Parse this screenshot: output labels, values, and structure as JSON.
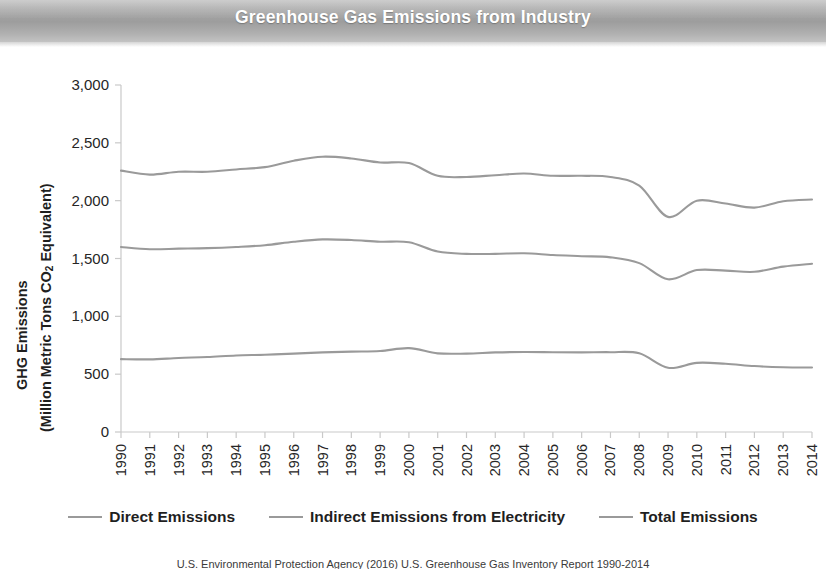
{
  "banner": {
    "title": "Greenhouse Gas Emissions from Industry",
    "background_color": "#a9a9a9",
    "text_color": "#ffffff"
  },
  "axis": {
    "y_title_line1": "GHG Emissions",
    "y_title_line2_pre": "(Million Metric Tons CO",
    "y_title_line2_sub": "2",
    "y_title_line2_post": " Equivalent)"
  },
  "legend": {
    "items": [
      {
        "label": "Direct Emissions",
        "color": "#9a9a9a"
      },
      {
        "label": "Indirect Emissions from Electricity",
        "color": "#9a9a9a"
      },
      {
        "label": "Total Emissions",
        "color": "#9a9a9a"
      }
    ]
  },
  "caption": {
    "text": "U.S. Environmental Protection Agency (2016) U.S. Greenhouse Gas Inventory Report 1990-2014"
  },
  "chart_data": {
    "type": "line",
    "title": "Greenhouse Gas Emissions from Industry",
    "xlabel": "",
    "ylabel": "GHG Emissions (Million Metric Tons CO2 Equivalent)",
    "ylim": [
      0,
      3000
    ],
    "yticks": [
      0,
      500,
      1000,
      1500,
      2000,
      2500,
      3000
    ],
    "ytick_labels": [
      "0",
      "500",
      "1,000",
      "1,500",
      "2,000",
      "2,500",
      "3,000"
    ],
    "grid": false,
    "legend_position": "bottom",
    "categories": [
      "1990",
      "1991",
      "1992",
      "1993",
      "1994",
      "1995",
      "1996",
      "1997",
      "1998",
      "1999",
      "2000",
      "2001",
      "2002",
      "2003",
      "2004",
      "2005",
      "2006",
      "2007",
      "2008",
      "2009",
      "2010",
      "2011",
      "2012",
      "2013",
      "2014"
    ],
    "series": [
      {
        "name": "Total Emissions",
        "color": "#9a9a9a",
        "values": [
          2260,
          2225,
          2250,
          2250,
          2270,
          2290,
          2345,
          2380,
          2365,
          2330,
          2325,
          2215,
          2205,
          2220,
          2235,
          2215,
          2215,
          2205,
          2130,
          1860,
          2000,
          1975,
          1940,
          1995,
          2010
        ]
      },
      {
        "name": "Indirect Emissions from Electricity",
        "color": "#9a9a9a",
        "values": [
          1600,
          1580,
          1585,
          1590,
          1600,
          1615,
          1645,
          1665,
          1660,
          1645,
          1640,
          1560,
          1540,
          1540,
          1545,
          1530,
          1520,
          1510,
          1460,
          1320,
          1400,
          1395,
          1385,
          1430,
          1455
        ]
      },
      {
        "name": "Direct Emissions",
        "color": "#9a9a9a",
        "values": [
          630,
          628,
          640,
          648,
          662,
          668,
          678,
          688,
          695,
          700,
          725,
          680,
          678,
          688,
          692,
          690,
          688,
          690,
          680,
          555,
          598,
          590,
          570,
          560,
          558
        ]
      }
    ]
  }
}
